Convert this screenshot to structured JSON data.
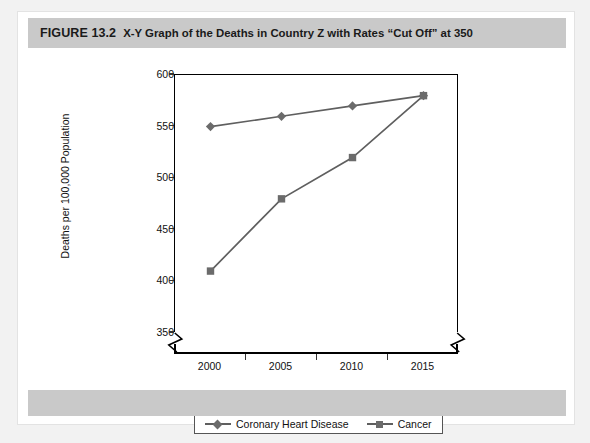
{
  "figure": {
    "label": "FIGURE 13.2",
    "title": "X-Y Graph of the Deaths in Country Z with Rates “Cut Off” at 350"
  },
  "colors": {
    "banner_gray": "#c9c9c9",
    "series_gray": "#6b6b6b",
    "line_gray": "#5f5f5f",
    "axis_black": "#000000",
    "page_gray": "#f2f2f2",
    "card_white": "#ffffff"
  },
  "axis_break": {
    "y_break": "zigzag",
    "x_break": "zigzag",
    "note": "axis broken below 350"
  },
  "chart_data": {
    "type": "line",
    "title": "X-Y Graph of the Deaths in Country Z with Rates “Cut Off” at 350",
    "xlabel": "",
    "ylabel": "Deaths per 100,000 Population",
    "categories": [
      "2000",
      "2005",
      "2010",
      "2015"
    ],
    "x": [
      2000,
      2005,
      2010,
      2015
    ],
    "ylim": [
      350,
      600
    ],
    "yticks": [
      350,
      400,
      450,
      500,
      550,
      600
    ],
    "grid": false,
    "legend_position": "bottom",
    "series": [
      {
        "name": "Coronary Heart Disease",
        "marker": "diamond",
        "color": "#6b6b6b",
        "values": [
          550,
          560,
          570,
          580
        ]
      },
      {
        "name": "Cancer",
        "marker": "square",
        "color": "#6b6b6b",
        "values": [
          410,
          480,
          520,
          580
        ]
      }
    ]
  }
}
